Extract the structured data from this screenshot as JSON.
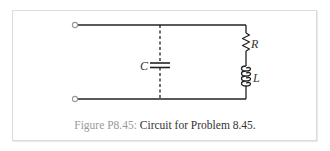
{
  "figure": {
    "caption_label": "Figure P8.45:",
    "caption_text": " Circuit for Problem 8.45."
  },
  "circuit": {
    "components": [
      {
        "type": "capacitor",
        "label": "C",
        "connection": "dashed"
      },
      {
        "type": "resistor",
        "label": "R"
      },
      {
        "type": "inductor",
        "label": "L"
      }
    ],
    "terminals": 2,
    "colors": {
      "wire": "#222222",
      "terminal": "#999999",
      "caption_label": "#9a9a9a",
      "border": "#dcdcdc"
    }
  }
}
